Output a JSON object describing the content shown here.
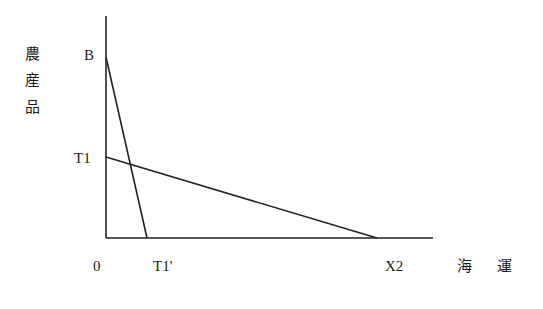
{
  "diagram": {
    "type": "production-possibility-frontiers",
    "y_axis_label": [
      "農",
      "産",
      "品"
    ],
    "x_axis_label": [
      "海",
      "運"
    ],
    "origin_label": "0",
    "points": {
      "B": "B",
      "T1": "T1",
      "T1_prime": "T1'",
      "X2": "X2"
    },
    "lines": [
      {
        "name": "B-T1'",
        "from": "B",
        "to": "T1'"
      },
      {
        "name": "T1-X2",
        "from": "T1",
        "to": "X2"
      }
    ]
  }
}
